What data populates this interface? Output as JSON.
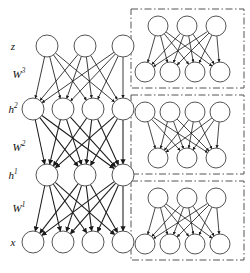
{
  "figure": {
    "node_fill": "#ffffff",
    "node_stroke": "#555555",
    "edge_color": "#1a1a1a",
    "panel_border_color": "#555555",
    "panel_border_style": "dash-dot"
  },
  "left_network": {
    "name": "full-stacked-network",
    "layers": [
      {
        "id": "z",
        "label": "z",
        "sup": "",
        "units": 3,
        "y": 46,
        "x_start": 47,
        "spacing": 38,
        "r": 11
      },
      {
        "id": "h2",
        "label": "h",
        "sup": "2",
        "units": 4,
        "y": 109,
        "x_start": 33,
        "spacing": 30,
        "r": 11
      },
      {
        "id": "h1",
        "label": "h",
        "sup": "1",
        "units": 3,
        "y": 175,
        "x_start": 47,
        "spacing": 38,
        "r": 11
      },
      {
        "id": "x",
        "label": "x",
        "sup": "",
        "units": 4,
        "y": 242,
        "x_start": 33,
        "spacing": 30,
        "r": 11
      }
    ],
    "weights": [
      {
        "id": "W3",
        "label": "W",
        "sup": "3",
        "from": "z",
        "to": "h2",
        "x": 19,
        "y": 74
      },
      {
        "id": "W2",
        "label": "W",
        "sup": "2",
        "from": "h2",
        "to": "h1",
        "x": 19,
        "y": 147
      },
      {
        "id": "W1",
        "label": "W",
        "sup": "1",
        "from": "h1",
        "to": "x",
        "x": 19,
        "y": 208
      }
    ],
    "layer_label_x": 13,
    "arrow_direction": "downward-generative"
  },
  "right_panels": [
    {
      "id": "panel-w3",
      "box": {
        "x": 131,
        "y": 9,
        "w": 113,
        "h": 79
      },
      "top_units": 3,
      "bottom_units": 4,
      "top_x_start": 158,
      "top_spacing": 29,
      "top_y": 26,
      "bottom_x_start": 145,
      "bottom_spacing": 25,
      "bottom_y": 72,
      "r": 10
    },
    {
      "id": "panel-w2",
      "box": {
        "x": 131,
        "y": 95,
        "w": 113,
        "h": 79
      },
      "top_units": 4,
      "bottom_units": 3,
      "top_x_start": 145,
      "top_spacing": 25,
      "top_y": 112,
      "bottom_x_start": 158,
      "bottom_spacing": 29,
      "bottom_y": 158,
      "r": 10
    },
    {
      "id": "panel-w1",
      "box": {
        "x": 131,
        "y": 181,
        "w": 113,
        "h": 79
      },
      "top_units": 3,
      "bottom_units": 4,
      "top_x_start": 158,
      "top_spacing": 29,
      "top_y": 198,
      "bottom_x_start": 145,
      "bottom_spacing": 25,
      "bottom_y": 244,
      "r": 10
    }
  ]
}
